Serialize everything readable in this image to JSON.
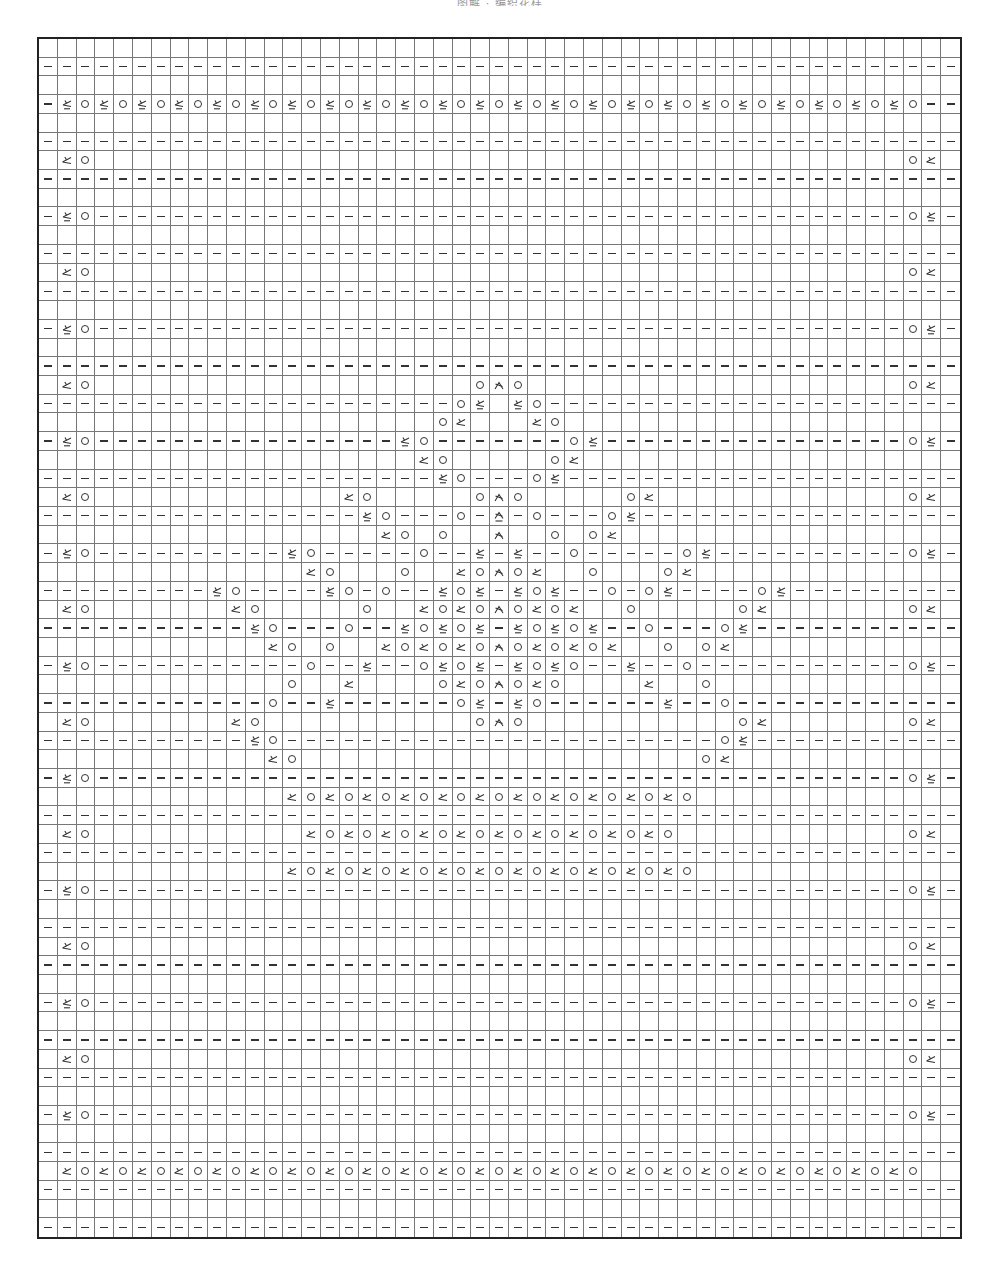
{
  "title": "图解 · 编织花样",
  "grid": {
    "columns": 49,
    "rows": 64
  },
  "legend": {
    "-": "purl (dash)",
    ".": "knit (blank)",
    "O": "yarn over (circle)",
    "k": "k2tog (left-leaning wedge)",
    "p": "purl 2 together (wedge with underline)",
    "s": "central double decrease (arrow wedge)",
    "S": "purl central double decrease (arrow wedge with underline)"
  },
  "row_types": {
    "D": "-------------------------------------------------",
    "B": ".................................................",
    "P": "-pO-------------------------------------------Op-",
    "K": ".kO...........................................Ok.",
    "FP": "-pOpOpOpOpOpOpOpOpOpOpOpOpOpOpOpOpOpOpOpOpOpOpO--",
    "FK": ".kOkOkOkOkOkOkOkOkOkOkOkOkOkOkOkOkOkOkOkOkOkOkO.."
  },
  "rows": [
    {
      "n": 1,
      "type": "B"
    },
    {
      "n": 2,
      "type": "D"
    },
    {
      "n": 3,
      "type": "B"
    },
    {
      "n": 4,
      "type": "FP"
    },
    {
      "n": 5,
      "type": "B"
    },
    {
      "n": 6,
      "type": "D"
    },
    {
      "n": 7,
      "type": "K"
    },
    {
      "n": 8,
      "type": "D"
    },
    {
      "n": 9,
      "type": "B"
    },
    {
      "n": 10,
      "type": "P"
    },
    {
      "n": 11,
      "type": "B"
    },
    {
      "n": 12,
      "type": "D"
    },
    {
      "n": 13,
      "type": "K"
    },
    {
      "n": 14,
      "type": "D"
    },
    {
      "n": 15,
      "type": "B"
    },
    {
      "n": 16,
      "type": "P"
    },
    {
      "n": 17,
      "type": "B"
    },
    {
      "n": 18,
      "type": "D"
    },
    {
      "n": 19,
      "type": "K",
      "mods": {
        "24": "O",
        "25": "s",
        "26": "O"
      }
    },
    {
      "n": 20,
      "type": "D",
      "mods": {
        "23": "O",
        "24": "p",
        "25": ".",
        "26": "p",
        "27": "O"
      }
    },
    {
      "n": 21,
      "type": "B",
      "mods": {
        "22": "O",
        "23": "k",
        "27": "k",
        "28": "O"
      }
    },
    {
      "n": 22,
      "type": "P",
      "mods": {
        "20": "p",
        "21": "O",
        "29": "O",
        "30": "p"
      }
    },
    {
      "n": 23,
      "type": "B",
      "mods": {
        "21": "k",
        "22": "O",
        "28": "O",
        "29": "k"
      }
    },
    {
      "n": 24,
      "type": "D",
      "mods": {
        "22": "p",
        "23": "O",
        "27": "O",
        "28": "p"
      }
    },
    {
      "n": 25,
      "type": "K",
      "mods": {
        "17": "k",
        "18": "O",
        "24": "O",
        "25": "s",
        "26": "O",
        "32": "O",
        "33": "k"
      }
    },
    {
      "n": 26,
      "type": "D",
      "mods": {
        "18": "p",
        "19": "O",
        "23": "O",
        "25": "S",
        "27": "O",
        "31": "O",
        "32": "p"
      }
    },
    {
      "n": 27,
      "type": "B",
      "mods": {
        "19": "k",
        "20": "O",
        "22": "O",
        "25": "s",
        "28": "O",
        "30": "O",
        "31": "k"
      }
    },
    {
      "n": 28,
      "type": "P",
      "mods": {
        "14": "p",
        "15": "O",
        "21": "O",
        "24": "p",
        "26": "p",
        "29": "O",
        "35": "O",
        "36": "p"
      }
    },
    {
      "n": 29,
      "type": "B",
      "mods": {
        "15": "k",
        "16": "O",
        "20": "O",
        "23": "k",
        "24": "O",
        "25": "s",
        "26": "O",
        "27": "k",
        "30": "O",
        "34": "O",
        "35": "k"
      }
    },
    {
      "n": 30,
      "type": "D",
      "mods": {
        "10": "p",
        "11": "O",
        "16": "p",
        "17": "O",
        "19": "O",
        "22": "p",
        "23": "O",
        "24": "p",
        "26": "p",
        "27": "O",
        "28": "p",
        "31": "O",
        "33": "O",
        "34": "p",
        "39": "O",
        "40": "p"
      }
    },
    {
      "n": 31,
      "type": "K",
      "mods": {
        "11": "k",
        "12": "O",
        "18": "O",
        "21": "k",
        "22": "O",
        "23": "k",
        "24": "O",
        "25": "s",
        "26": "O",
        "27": "k",
        "28": "O",
        "29": "k",
        "32": "O",
        "38": "O",
        "39": "k"
      }
    },
    {
      "n": 32,
      "type": "D",
      "mods": {
        "12": "p",
        "13": "O",
        "17": "O",
        "20": "p",
        "21": "O",
        "22": "p",
        "23": "O",
        "24": "p",
        "26": "p",
        "27": "O",
        "28": "p",
        "29": "O",
        "30": "p",
        "33": "O",
        "37": "O",
        "38": "p"
      }
    },
    {
      "n": 33,
      "type": "B",
      "mods": {
        "13": "k",
        "14": "O",
        "16": "O",
        "19": "k",
        "20": "O",
        "21": "k",
        "22": "O",
        "23": "k",
        "24": "O",
        "25": "s",
        "26": "O",
        "27": "k",
        "28": "O",
        "29": "k",
        "30": "O",
        "31": "k",
        "34": "O",
        "36": "O",
        "37": "k"
      }
    },
    {
      "n": 34,
      "type": "P",
      "mods": {
        "15": "O",
        "18": "p",
        "21": "O",
        "22": "p",
        "23": "O",
        "24": "p",
        "26": "p",
        "27": "O",
        "28": "p",
        "29": "O",
        "32": "p",
        "35": "O"
      }
    },
    {
      "n": 35,
      "type": "B",
      "mods": {
        "14": "O",
        "17": "k",
        "22": "O",
        "23": "k",
        "24": "O",
        "25": "s",
        "26": "O",
        "27": "k",
        "28": "O",
        "33": "k",
        "36": "O"
      }
    },
    {
      "n": 36,
      "type": "D",
      "mods": {
        "13": "O",
        "16": "p",
        "23": "O",
        "24": "p",
        "26": "p",
        "27": "O",
        "34": "p",
        "37": "O"
      }
    },
    {
      "n": 37,
      "type": "K",
      "mods": {
        "11": "k",
        "12": "O",
        "24": "O",
        "25": "s",
        "26": "O",
        "38": "O",
        "39": "k"
      }
    },
    {
      "n": 38,
      "type": "D",
      "mods": {
        "12": "p",
        "13": "O",
        "37": "O",
        "38": "p"
      }
    },
    {
      "n": 39,
      "type": "B",
      "mods": {
        "13": "k",
        "14": "O",
        "36": "O",
        "37": "k"
      }
    },
    {
      "n": 40,
      "type": "P"
    },
    {
      "n": 41,
      "type": "B",
      "pairs": {
        "from": 14,
        "to": 35
      }
    },
    {
      "n": 42,
      "type": "D"
    },
    {
      "n": 43,
      "type": "K",
      "pairs": {
        "from": 15,
        "to": 34
      }
    },
    {
      "n": 44,
      "type": "D"
    },
    {
      "n": 45,
      "type": "B",
      "pairs": {
        "from": 14,
        "to": 35
      }
    },
    {
      "n": 46,
      "type": "P"
    },
    {
      "n": 47,
      "type": "B"
    },
    {
      "n": 48,
      "type": "D"
    },
    {
      "n": 49,
      "type": "K"
    },
    {
      "n": 50,
      "type": "D"
    },
    {
      "n": 51,
      "type": "B"
    },
    {
      "n": 52,
      "type": "P"
    },
    {
      "n": 53,
      "type": "B"
    },
    {
      "n": 54,
      "type": "D"
    },
    {
      "n": 55,
      "type": "K"
    },
    {
      "n": 56,
      "type": "D"
    },
    {
      "n": 57,
      "type": "B"
    },
    {
      "n": 58,
      "type": "P"
    },
    {
      "n": 59,
      "type": "B"
    },
    {
      "n": 60,
      "type": "D"
    },
    {
      "n": 61,
      "type": "FK"
    },
    {
      "n": 62,
      "type": "D"
    },
    {
      "n": 63,
      "type": "B"
    },
    {
      "n": 64,
      "type": "D"
    }
  ]
}
